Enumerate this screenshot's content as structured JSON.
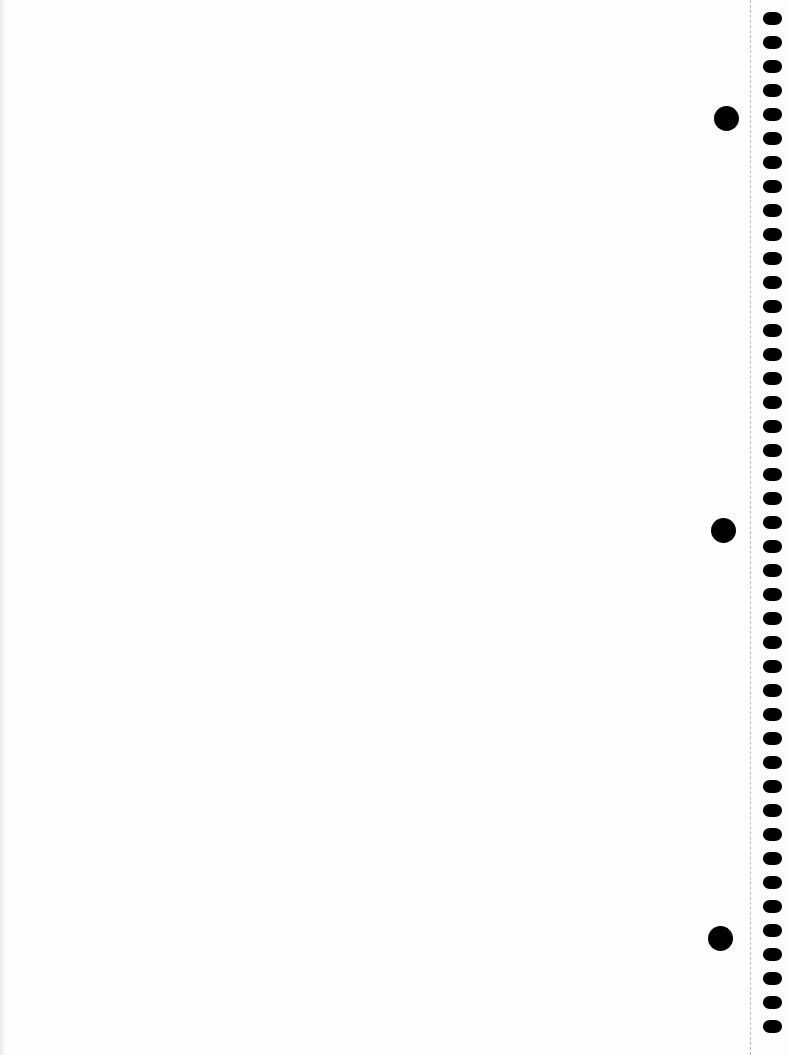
{
  "page": {
    "type": "blank notebook page",
    "background_color": "#fdfdfd",
    "hole_color": "#000000",
    "perforation_color": "#bdbdbd"
  },
  "spiral_holes": {
    "count": 43,
    "x": 763,
    "first_y": 12,
    "spacing": 24
  },
  "punch_holes": [
    {
      "cx": 726,
      "cy": 118
    },
    {
      "cx": 723,
      "cy": 530
    },
    {
      "cx": 720,
      "cy": 938
    }
  ]
}
